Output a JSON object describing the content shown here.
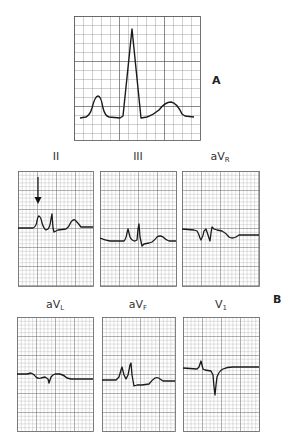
{
  "figure": {
    "section_a_label": "A",
    "section_b_label": "B",
    "colors": {
      "grid_minor": "#9a9a9a",
      "grid_major": "#555555",
      "trace": "#1a1a1a",
      "label": "#333333"
    }
  },
  "panel_a": {
    "description": "Normal ECG complex: P wave, QRS complex, T wave"
  },
  "leads": [
    {
      "id": "II",
      "base": "II",
      "sub": "",
      "annotation": "arrow pointing to P wave"
    },
    {
      "id": "III",
      "base": "III",
      "sub": ""
    },
    {
      "id": "aVR",
      "base": "aV",
      "sub": "R"
    },
    {
      "id": "aVL",
      "base": "aV",
      "sub": "L"
    },
    {
      "id": "aVF",
      "base": "aV",
      "sub": "F"
    },
    {
      "id": "V1",
      "base": "V",
      "sub": "1"
    }
  ]
}
